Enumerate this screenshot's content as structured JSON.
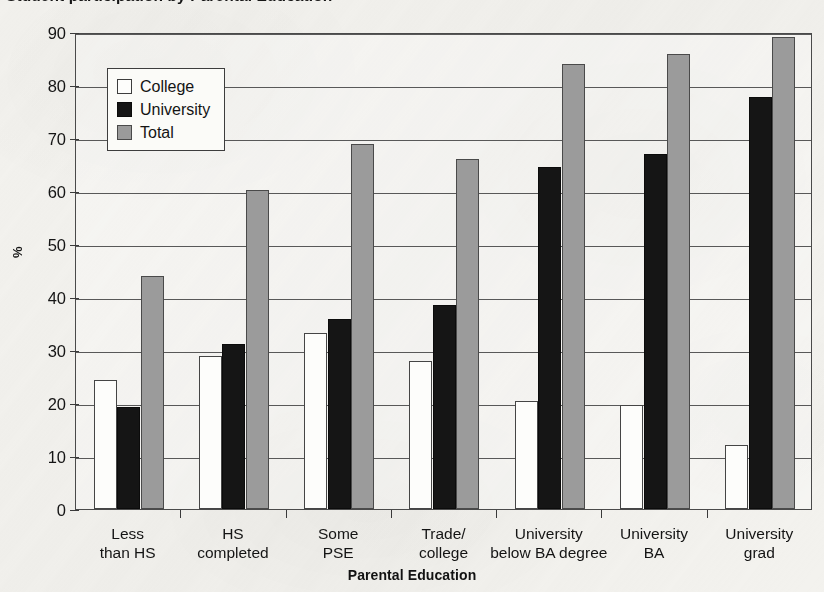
{
  "title_partial": "Student participation by Parental Education",
  "axis": {
    "y_title": "%",
    "x_title": "Parental Education"
  },
  "legend": {
    "items": [
      {
        "label": "College",
        "key": "college",
        "color": "#ffffff"
      },
      {
        "label": "University",
        "key": "university",
        "color": "#151515"
      },
      {
        "label": "Total",
        "key": "total",
        "color": "#9b9b9b"
      }
    ]
  },
  "chart_data": {
    "type": "bar",
    "title": "",
    "xlabel": "Parental Education",
    "ylabel": "%",
    "ylim": [
      0,
      90
    ],
    "yticks": [
      0,
      10,
      20,
      30,
      40,
      50,
      60,
      70,
      80,
      90
    ],
    "grid": true,
    "legend_position": "upper-left-inside",
    "categories": [
      "Less\nthan HS",
      "HS\ncompleted",
      "Some\nPSE",
      "Trade/\ncollege",
      "University\nbelow BA degree",
      "University\nBA",
      "University\ngrad"
    ],
    "category_lines": [
      [
        "Less",
        "than HS"
      ],
      [
        "HS",
        "completed"
      ],
      [
        "Some",
        "PSE"
      ],
      [
        "Trade/",
        "college"
      ],
      [
        "University",
        "below BA degree"
      ],
      [
        "University",
        "BA"
      ],
      [
        "University",
        "grad"
      ]
    ],
    "series": [
      {
        "name": "College",
        "color": "#ffffff",
        "values": [
          24.4,
          28.9,
          33.3,
          27.9,
          20.3,
          19.7,
          12.0
        ]
      },
      {
        "name": "University",
        "color": "#151515",
        "values": [
          19.2,
          31.1,
          35.8,
          38.5,
          64.5,
          66.9,
          77.8
        ]
      },
      {
        "name": "Total",
        "color": "#9b9b9b",
        "values": [
          44.0,
          60.2,
          68.9,
          66.0,
          83.9,
          85.8,
          89.0
        ]
      }
    ]
  }
}
